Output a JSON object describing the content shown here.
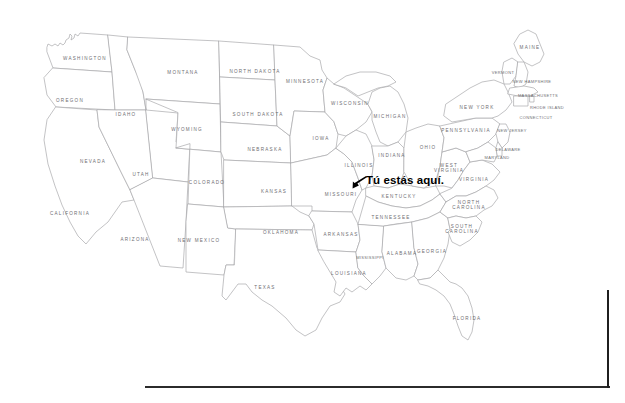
{
  "slide": {
    "title": "Mapa de los Estados Unidos",
    "background_color": "#ffffff",
    "frame_line_color": "#2b2b2b"
  },
  "map": {
    "name": "united-states-outline-map",
    "outline_color": "#a9a9ac",
    "fill_color": "#ffffff",
    "label_color": "#6e6e72",
    "states": [
      {
        "code": "WA",
        "label": "WASHINGTON",
        "x": 85,
        "y": 59,
        "size": "normal"
      },
      {
        "code": "OR",
        "label": "OREGON",
        "x": 70,
        "y": 101,
        "size": "normal"
      },
      {
        "code": "CA",
        "label": "CALIFORNIA",
        "x": 70,
        "y": 214,
        "size": "normal"
      },
      {
        "code": "ID",
        "label": "IDAHO",
        "x": 126,
        "y": 115,
        "size": "normal"
      },
      {
        "code": "NV",
        "label": "NEVADA",
        "x": 93,
        "y": 162,
        "size": "normal"
      },
      {
        "code": "UT",
        "label": "UTAH",
        "x": 141,
        "y": 175,
        "size": "normal"
      },
      {
        "code": "AZ",
        "label": "ARIZONA",
        "x": 135,
        "y": 240,
        "size": "normal"
      },
      {
        "code": "MT",
        "label": "MONTANA",
        "x": 183,
        "y": 73,
        "size": "normal"
      },
      {
        "code": "WY",
        "label": "WYOMING",
        "x": 187,
        "y": 130,
        "size": "normal"
      },
      {
        "code": "CO",
        "label": "COLORADO",
        "x": 207,
        "y": 183,
        "size": "normal"
      },
      {
        "code": "NM",
        "label": "NEW MEXICO",
        "x": 199,
        "y": 241,
        "size": "normal"
      },
      {
        "code": "ND",
        "label": "NORTH DAKOTA",
        "x": 255,
        "y": 72,
        "size": "normal"
      },
      {
        "code": "SD",
        "label": "SOUTH DAKOTA",
        "x": 258,
        "y": 115,
        "size": "normal"
      },
      {
        "code": "NE",
        "label": "NEBRASKA",
        "x": 265,
        "y": 150,
        "size": "normal"
      },
      {
        "code": "KS",
        "label": "KANSAS",
        "x": 274,
        "y": 192,
        "size": "normal"
      },
      {
        "code": "OK",
        "label": "OKLAHOMA",
        "x": 281,
        "y": 233,
        "size": "normal"
      },
      {
        "code": "TX",
        "label": "TEXAS",
        "x": 265,
        "y": 288,
        "size": "normal"
      },
      {
        "code": "MN",
        "label": "MINNESOTA",
        "x": 305,
        "y": 82,
        "size": "normal"
      },
      {
        "code": "IA",
        "label": "IOWA",
        "x": 321,
        "y": 139,
        "size": "normal"
      },
      {
        "code": "MO",
        "label": "MISSOURI",
        "x": 341,
        "y": 195,
        "size": "normal"
      },
      {
        "code": "AR",
        "label": "ARKANSAS",
        "x": 341,
        "y": 235,
        "size": "normal"
      },
      {
        "code": "LA",
        "label": "LOUISIANA",
        "x": 349,
        "y": 274,
        "size": "normal"
      },
      {
        "code": "WI",
        "label": "WISCONSIN",
        "x": 350,
        "y": 104,
        "size": "normal"
      },
      {
        "code": "IL",
        "label": "ILLINOIS",
        "x": 359,
        "y": 166,
        "size": "normal"
      },
      {
        "code": "MS",
        "label": "MISSISSIPPI",
        "x": 370,
        "y": 258,
        "size": "tiny"
      },
      {
        "code": "MI",
        "label": "MICHIGAN",
        "x": 390,
        "y": 117,
        "size": "normal"
      },
      {
        "code": "IN",
        "label": "INDIANA",
        "x": 392,
        "y": 156,
        "size": "normal"
      },
      {
        "code": "KY",
        "label": "KENTUCKY",
        "x": 399,
        "y": 197,
        "size": "normal"
      },
      {
        "code": "TN",
        "label": "TENNESSEE",
        "x": 391,
        "y": 218,
        "size": "normal"
      },
      {
        "code": "AL",
        "label": "ALABAMA",
        "x": 402,
        "y": 254,
        "size": "normal"
      },
      {
        "code": "GA",
        "label": "GEORGIA",
        "x": 432,
        "y": 252,
        "size": "normal"
      },
      {
        "code": "OH",
        "label": "OHIO",
        "x": 428,
        "y": 148,
        "size": "normal"
      },
      {
        "code": "WV",
        "label": "WEST\nVIRGINIA",
        "x": 449,
        "y": 168,
        "size": "normal"
      },
      {
        "code": "VA",
        "label": "VIRGINIA",
        "x": 474,
        "y": 180,
        "size": "normal"
      },
      {
        "code": "NC",
        "label": "NORTH\nCAROLINA",
        "x": 469,
        "y": 205,
        "size": "normal"
      },
      {
        "code": "SC",
        "label": "SOUTH\nCAROLINA",
        "x": 462,
        "y": 229,
        "size": "normal"
      },
      {
        "code": "FL",
        "label": "FLORIDA",
        "x": 467,
        "y": 319,
        "size": "normal"
      },
      {
        "code": "PA",
        "label": "PENNSYLVANIA",
        "x": 466,
        "y": 131,
        "size": "normal"
      },
      {
        "code": "NY",
        "label": "NEW YORK",
        "x": 477,
        "y": 108,
        "size": "normal"
      },
      {
        "code": "ME",
        "label": "MAINE",
        "x": 530,
        "y": 48,
        "size": "normal"
      },
      {
        "code": "VT",
        "label": "VERMONT",
        "x": 503,
        "y": 73,
        "size": "tiny"
      },
      {
        "code": "NH",
        "label": "NEW HAMPSHIRE",
        "x": 532,
        "y": 82,
        "size": "tiny"
      },
      {
        "code": "MA",
        "label": "MASSACHUSETTS",
        "x": 538,
        "y": 96,
        "size": "tiny"
      },
      {
        "code": "RI",
        "label": "RHODE ISLAND",
        "x": 547,
        "y": 108,
        "size": "tiny"
      },
      {
        "code": "CT",
        "label": "CONNECTICUT",
        "x": 536,
        "y": 118,
        "size": "tiny"
      },
      {
        "code": "NJ",
        "label": "NEW JERSEY",
        "x": 512,
        "y": 131,
        "size": "tiny"
      },
      {
        "code": "DE",
        "label": "DELAWARE",
        "x": 508,
        "y": 150,
        "size": "tiny"
      },
      {
        "code": "MD",
        "label": "MARYLAND",
        "x": 497,
        "y": 158,
        "size": "tiny"
      }
    ]
  },
  "annotation": {
    "text": "Tú estás aquí.",
    "color": "#000000",
    "arrow_icon": "arrow-pointing-down-left",
    "points_to": "MO"
  }
}
